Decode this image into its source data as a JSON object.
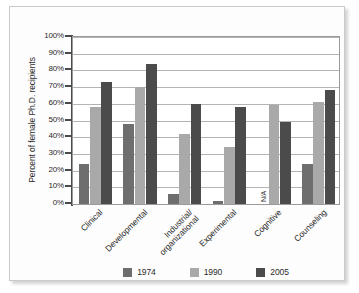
{
  "chart_data": {
    "type": "bar",
    "title": "",
    "xlabel": "",
    "ylabel": "Percent of female Ph.D. recipients",
    "ylim": [
      0,
      100
    ],
    "grid": true,
    "legend_position": "bottom",
    "categories": [
      "Clinical",
      "Industrial/\norganizational",
      "Developmental",
      "Experimental",
      "Cognitive",
      "Counseling"
    ],
    "category_labels": [
      {
        "line1": "Clinical",
        "line2": ""
      },
      {
        "line1": "Developmental",
        "line2": ""
      },
      {
        "line1": "Industrial/",
        "line2": "organizational"
      },
      {
        "line1": "Experimental",
        "line2": ""
      },
      {
        "line1": "Cognitive",
        "line2": ""
      },
      {
        "line1": "Counseling",
        "line2": ""
      }
    ],
    "ytick_labels": [
      "100%",
      "90%",
      "80%",
      "70%",
      "60%",
      "50%",
      "40%",
      "30%",
      "20%",
      "10%",
      "0%"
    ],
    "ytick_values": [
      100,
      90,
      80,
      70,
      60,
      50,
      40,
      30,
      20,
      10,
      0
    ],
    "series": [
      {
        "name": "1974",
        "color": "#6e6e6e",
        "values": [
          24,
          48,
          6,
          2,
          null,
          24
        ],
        "value_labels": [
          "24%",
          "48%",
          "6%",
          "2%",
          "N/A",
          "24%"
        ]
      },
      {
        "name": "1990",
        "color": "#a9a9a9",
        "values": [
          58,
          70,
          42,
          34,
          59,
          61
        ],
        "value_labels": [
          "58%",
          "70%",
          "42%",
          "34%",
          "59%",
          "61%"
        ]
      },
      {
        "name": "2005",
        "color": "#4b4b4b",
        "values": [
          73,
          84,
          60,
          58,
          49,
          68
        ],
        "value_labels": [
          "73%",
          "84%",
          "60%",
          "58%",
          "49%",
          "68%"
        ]
      }
    ],
    "annotations": [
      {
        "text": "N/A",
        "category": "Cognitive",
        "series": "1974"
      }
    ]
  },
  "legend": {
    "items": [
      {
        "label": "1974",
        "color": "#6e6e6e"
      },
      {
        "label": "1990",
        "color": "#a9a9a9"
      },
      {
        "label": "2005",
        "color": "#4b4b4b"
      }
    ]
  }
}
